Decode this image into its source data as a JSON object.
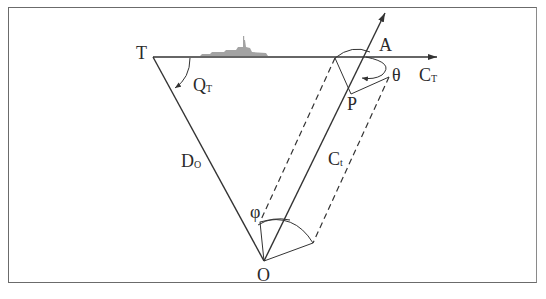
{
  "diagram": {
    "labels": {
      "T": "T",
      "Q_main": "Q",
      "Q_sub": "T",
      "A": "A",
      "theta": "θ",
      "C_T_main": "C",
      "C_T_sub": "T",
      "P": "P",
      "D_O_main": "D",
      "D_O_sub": "O",
      "C_t_main": "C",
      "C_t_sub": "t",
      "phi": "φ",
      "O": "O"
    },
    "icons": {
      "ship": "ship-icon"
    },
    "colors": {
      "line": "#333333",
      "frame": "#6b6b6b",
      "ship": "#9a9a9a"
    }
  }
}
